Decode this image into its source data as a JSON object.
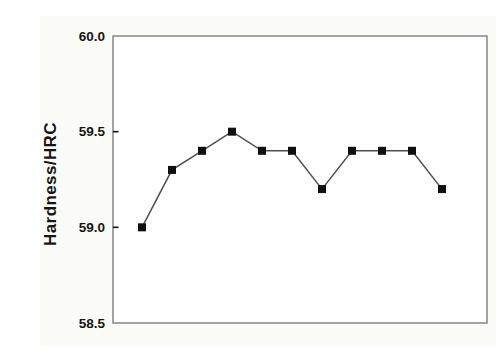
{
  "chart_data": {
    "type": "line",
    "title": "",
    "xlabel": "",
    "ylabel": "Hardness/HRC",
    "x": [
      1,
      2,
      3,
      4,
      5,
      6,
      7,
      8,
      9,
      10,
      11
    ],
    "values": [
      59.0,
      59.3,
      59.4,
      59.5,
      59.4,
      59.4,
      59.2,
      59.4,
      59.4,
      59.4,
      59.2
    ],
    "ylim": [
      58.5,
      60.0
    ],
    "yticks": [
      60.0,
      59.5,
      59.0,
      58.5
    ],
    "ytick_labels": [
      "60.0",
      "59.5",
      "59.0",
      "58.5"
    ],
    "xticks": [],
    "xtick_labels": [],
    "grid": false,
    "legend": "none",
    "marker": "filled-square",
    "frame": "full-box"
  },
  "colors": {
    "background": "#fbfbf8",
    "plot_background": "#fefefe",
    "frame": "#7d7d7d",
    "axis_text": "#141414",
    "line": "#4f4f4f",
    "marker": "#0f0f0f"
  }
}
